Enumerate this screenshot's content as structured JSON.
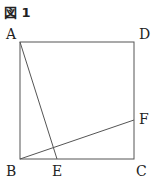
{
  "figure": {
    "title": "図 1",
    "labels": {
      "A": "A",
      "B": "B",
      "C": "C",
      "D": "D",
      "E": "E",
      "F": "F"
    },
    "shape": "square ABCD with segments AE and BF",
    "line_color": "#555555"
  }
}
